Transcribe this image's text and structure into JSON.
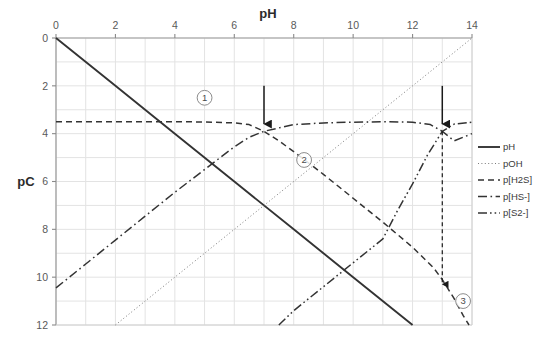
{
  "chart_data": {
    "type": "line",
    "title": "",
    "xlabel": "pH",
    "ylabel": "pC",
    "xlim": [
      0,
      14
    ],
    "ylim": [
      12,
      0
    ],
    "y_inverted": true,
    "grid": true,
    "x_ticks": [
      0,
      2,
      4,
      6,
      8,
      10,
      12,
      14
    ],
    "y_ticks": [
      0,
      2,
      4,
      6,
      8,
      10,
      12
    ],
    "x_tick_labels": [
      "0",
      "2",
      "4",
      "6",
      "8",
      "10",
      "12",
      "14"
    ],
    "y_tick_labels": [
      "0",
      "2",
      "4",
      "6",
      "8",
      "10",
      "12"
    ],
    "legend_position": "right",
    "series": [
      {
        "name": "pH",
        "style": "solid",
        "color": "#333333",
        "points": [
          [
            0,
            0
          ],
          [
            2,
            2
          ],
          [
            4,
            4
          ],
          [
            6,
            6
          ],
          [
            8,
            8
          ],
          [
            10,
            10
          ],
          [
            12,
            12
          ]
        ]
      },
      {
        "name": "pOH",
        "style": "dotted",
        "color": "#7a7a7a",
        "points": [
          [
            2,
            12
          ],
          [
            4,
            10
          ],
          [
            6,
            8
          ],
          [
            8,
            6
          ],
          [
            10,
            4
          ],
          [
            12,
            2
          ],
          [
            14,
            0
          ]
        ]
      },
      {
        "name": "p[H2S]",
        "style": "dashed",
        "color": "#333333",
        "points": [
          [
            0,
            3.5
          ],
          [
            1,
            3.5
          ],
          [
            2,
            3.5
          ],
          [
            3,
            3.5
          ],
          [
            4,
            3.5
          ],
          [
            5,
            3.51
          ],
          [
            6,
            3.55
          ],
          [
            6.5,
            3.62
          ],
          [
            7,
            3.9
          ],
          [
            7.5,
            4.3
          ],
          [
            8,
            4.75
          ],
          [
            9,
            5.7
          ],
          [
            10,
            6.7
          ],
          [
            11,
            7.7
          ],
          [
            12,
            8.75
          ],
          [
            12.7,
            9.6
          ],
          [
            13,
            10.1
          ],
          [
            13.4,
            10.9
          ],
          [
            13.7,
            11.6
          ],
          [
            13.9,
            12
          ]
        ]
      },
      {
        "name": "p[HS-]",
        "style": "dashdot",
        "color": "#333333",
        "points": [
          [
            0,
            10.45
          ],
          [
            1,
            9.45
          ],
          [
            2,
            8.45
          ],
          [
            3,
            7.45
          ],
          [
            4,
            6.45
          ],
          [
            5,
            5.5
          ],
          [
            6,
            4.55
          ],
          [
            6.5,
            4.15
          ],
          [
            7,
            3.9
          ],
          [
            8,
            3.62
          ],
          [
            9,
            3.55
          ],
          [
            10,
            3.52
          ],
          [
            11,
            3.5
          ],
          [
            12,
            3.52
          ],
          [
            12.6,
            3.62
          ],
          [
            13,
            3.9
          ],
          [
            13.4,
            4.3
          ],
          [
            14,
            4.0
          ]
        ]
      },
      {
        "name": "p[S2-]",
        "style": "dashdotdot",
        "color": "#333333",
        "points": [
          [
            7.5,
            12
          ],
          [
            8,
            11.4
          ],
          [
            9,
            10.4
          ],
          [
            10,
            9.4
          ],
          [
            11,
            8.4
          ],
          [
            11.5,
            7.2
          ],
          [
            12,
            6.1
          ],
          [
            12.5,
            4.9
          ],
          [
            13,
            3.9
          ],
          [
            13.4,
            3.6
          ],
          [
            14,
            3.52
          ]
        ]
      }
    ],
    "annotations": [
      {
        "label": "①",
        "x": 5.0,
        "y": 2.5,
        "kind": "circled-number"
      },
      {
        "label": "②",
        "x": 8.35,
        "y": 5.1,
        "kind": "circled-number"
      },
      {
        "label": "③",
        "x": 13.7,
        "y": 11.0,
        "kind": "circled-number"
      },
      {
        "label": "arrow-down-crossing-1",
        "x": 7.0,
        "y_from": 2.0,
        "y_to": 3.6,
        "kind": "arrow"
      },
      {
        "label": "arrow-down-crossing-2",
        "x": 13.0,
        "y_from": 2.0,
        "y_to": 3.6,
        "kind": "arrow"
      },
      {
        "label": "arrow-down-dashed-drop",
        "x": 13.0,
        "y_from": 3.9,
        "y_to": 10.3,
        "kind": "dashed-arrow"
      }
    ]
  },
  "legend": {
    "items": [
      {
        "label": "pH",
        "style": "solid"
      },
      {
        "label": "pOH",
        "style": "dotted"
      },
      {
        "label": "p[H2S]",
        "style": "dashed"
      },
      {
        "label": "p[HS-]",
        "style": "dashdot"
      },
      {
        "label": "p[S2-]",
        "style": "dashdotdot"
      }
    ]
  },
  "axes": {
    "x_title": "pH",
    "y_title": "pC"
  }
}
